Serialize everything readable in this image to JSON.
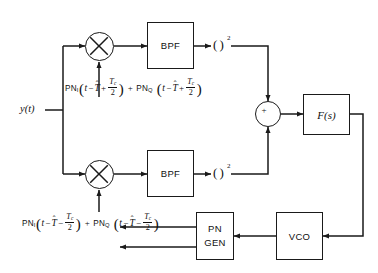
{
  "diagram": {
    "input_label": "y(t)",
    "blocks": [
      {
        "id": "bpf_upper",
        "label": "BPF"
      },
      {
        "id": "bpf_lower",
        "label": "BPF"
      },
      {
        "id": "loop_filter",
        "label": "F(s)"
      },
      {
        "id": "pn_gen",
        "line1": "PN",
        "line2": "GEN"
      },
      {
        "id": "vco",
        "label": "VCO"
      }
    ],
    "operators": {
      "multiplier_symbol": "⊗",
      "summer_symbol": "+",
      "square_open": "(",
      "square_close": ")",
      "square_exponent": "2"
    },
    "equations": {
      "upper": {
        "pn_name_1": "PN",
        "pn_sub_1": "I",
        "arg_var": "t",
        "minus": "−",
        "delay_sym": "T",
        "delay_hat": "ˆ",
        "sign": "+",
        "frac_num": "T",
        "frac_num_sub": "c",
        "frac_den": "2",
        "joiner": "+",
        "pn_name_2": "PN",
        "pn_sub_2": "Q",
        "plain": "PN_I(t − T̂ + Tc/2) + PN_Q(t − T̂ + Tc/2)"
      },
      "lower": {
        "pn_name_1": "PN",
        "pn_sub_1": "I",
        "arg_var": "t",
        "minus": "−",
        "delay_sym": "T",
        "delay_hat": "ˆ",
        "sign": "−",
        "frac_num": "T",
        "frac_num_sub": "c",
        "frac_den": "2",
        "joiner": "+",
        "pn_name_2": "PN",
        "pn_sub_2": "Q",
        "plain": "PN_I(t − T̂ − Tc/2) + PN_Q(t − T̂ − Tc/2)"
      }
    },
    "colors": {
      "line": "#1a1a1a",
      "background": "#ffffff",
      "text": "#111111"
    }
  }
}
